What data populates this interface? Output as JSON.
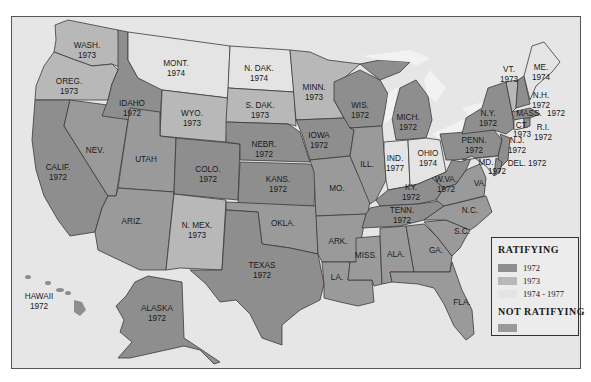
{
  "colors": {
    "r1972": "#8e8e8e",
    "r1973": "#b8b8b8",
    "r1974_1977": "#e4e4e4",
    "not_ratifying": "#9a9a9a",
    "water": "#e6e6e6",
    "lakes": "#f2f2f2"
  },
  "legend": {
    "title": "RATIFYING",
    "items": [
      {
        "label": "1972",
        "category": "r1972"
      },
      {
        "label": "1973",
        "category": "r1973"
      },
      {
        "label": "1974 - 1977",
        "category": "r1974_1977"
      }
    ],
    "not_ratifying_title": "NOT  RATIFYING"
  },
  "states": {
    "wash": {
      "name": "WASH.",
      "year": "1973"
    },
    "oreg": {
      "name": "OREG.",
      "year": "1973"
    },
    "calif": {
      "name": "CALIF.",
      "year": "1972"
    },
    "idaho": {
      "name": "IDAHO",
      "year": "1972"
    },
    "nev": {
      "name": "NEV.",
      "year": ""
    },
    "mont": {
      "name": "MONT.",
      "year": "1974"
    },
    "wyo": {
      "name": "WYO.",
      "year": "1973"
    },
    "utah": {
      "name": "UTAH",
      "year": ""
    },
    "ariz": {
      "name": "ARIZ.",
      "year": ""
    },
    "colo": {
      "name": "COLO.",
      "year": "1972"
    },
    "nmex": {
      "name": "N. MEX.",
      "year": "1973"
    },
    "ndak": {
      "name": "N. DAK.",
      "year": "1974"
    },
    "sdak": {
      "name": "S. DAK.",
      "year": "1973"
    },
    "nebr": {
      "name": "NEBR.",
      "year": "1972"
    },
    "kans": {
      "name": "KANS.",
      "year": "1972"
    },
    "okla": {
      "name": "OKLA.",
      "year": ""
    },
    "texas": {
      "name": "TEXAS",
      "year": "1972"
    },
    "minn": {
      "name": "MINN.",
      "year": "1973"
    },
    "iowa": {
      "name": "IOWA",
      "year": "1972"
    },
    "mo": {
      "name": "MO.",
      "year": ""
    },
    "ark": {
      "name": "ARK.",
      "year": ""
    },
    "la": {
      "name": "LA.",
      "year": ""
    },
    "wis": {
      "name": "WIS.",
      "year": "1972"
    },
    "ill": {
      "name": "ILL.",
      "year": ""
    },
    "mich": {
      "name": "MICH.",
      "year": "1972"
    },
    "ind": {
      "name": "IND.",
      "year": "1977"
    },
    "ohio": {
      "name": "OHIO",
      "year": "1974"
    },
    "ky": {
      "name": "KY.",
      "year": "1972"
    },
    "tenn": {
      "name": "TENN.",
      "year": "1972"
    },
    "miss": {
      "name": "MISS.",
      "year": ""
    },
    "ala": {
      "name": "ALA.",
      "year": ""
    },
    "ga": {
      "name": "GA.",
      "year": ""
    },
    "fla": {
      "name": "FLA.",
      "year": ""
    },
    "sc": {
      "name": "S.C.",
      "year": ""
    },
    "nc": {
      "name": "N.C.",
      "year": ""
    },
    "va": {
      "name": "VA.",
      "year": ""
    },
    "wva": {
      "name": "W.VA.",
      "year": "1972"
    },
    "penn": {
      "name": "PENN.",
      "year": "1972"
    },
    "ny": {
      "name": "N.Y.",
      "year": "1972"
    },
    "nj": {
      "name": "N.J.",
      "year": "1972"
    },
    "md": {
      "name": "MD.",
      "year": "1972"
    },
    "del": {
      "name": "DEL.",
      "year": "1972"
    },
    "vt": {
      "name": "VT.",
      "year": "1973"
    },
    "nh": {
      "name": "N.H.",
      "year": "1972"
    },
    "me": {
      "name": "ME.",
      "year": "1974"
    },
    "mass": {
      "name": "MASS.",
      "year": "1972"
    },
    "ct": {
      "name": "CT.",
      "year": "1973"
    },
    "ri": {
      "name": "R.I.",
      "year": "1972"
    },
    "hawaii": {
      "name": "HAWAII",
      "year": "1972"
    },
    "alaska": {
      "name": "ALASKA",
      "year": "1972"
    }
  },
  "labels": {
    "del_inline": "DEL. 1972",
    "mass_year": "1972"
  }
}
